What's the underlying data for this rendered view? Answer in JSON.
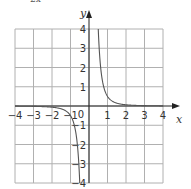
{
  "caption": "2x",
  "chart_data": {
    "type": "line",
    "title": "",
    "function": "y = 1/(2x^3)",
    "xlabel": "x",
    "ylabel": "y",
    "xlim": [
      -4,
      4
    ],
    "ylim": [
      -4,
      4
    ],
    "grid": true,
    "x_ticks": [
      -4,
      -3,
      -2,
      -1,
      0,
      1,
      2,
      3,
      4
    ],
    "y_ticks": [
      -4,
      -3,
      -2,
      -1,
      1,
      2,
      3,
      4
    ],
    "origin_label": "0",
    "series": [
      {
        "name": "right branch",
        "x": [
          0.5,
          0.6,
          0.75,
          1,
          1.5,
          2,
          3,
          4
        ],
        "values": [
          4,
          2.31,
          1.19,
          0.5,
          0.15,
          0.06,
          0.02,
          0.01
        ]
      },
      {
        "name": "left branch",
        "x": [
          -4,
          -3,
          -2,
          -1.5,
          -1,
          -0.75,
          -0.6,
          -0.5
        ],
        "values": [
          -0.01,
          -0.02,
          -0.06,
          -0.15,
          -0.5,
          -1.19,
          -2.31,
          -4
        ]
      }
    ],
    "colors": {
      "grid": "#b0b0b0",
      "axis": "#222222",
      "curve": "#555555"
    }
  }
}
